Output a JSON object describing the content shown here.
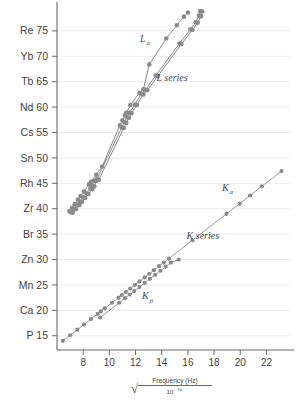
{
  "chart_data": {
    "type": "scatter",
    "title": "",
    "subtitle": "",
    "xlabel_parts": {
      "radical": "√",
      "numerator": "Frequency (Hz)",
      "denominator_base": "10",
      "denominator_exp": "15"
    },
    "ylabel": "",
    "xlim": [
      6.0,
      23.8
    ],
    "ylim": [
      12.2,
      79.5
    ],
    "grid": "horizontal-only",
    "legend_position": "inline-annotations",
    "marker_color": "#8a8a8a",
    "k_line_color": "#9a9a9a",
    "l_line_color": "#8a8a8a",
    "axis_color": "#6b6b6b",
    "gridline_color": "#ececec",
    "x_ticks": [
      8,
      10,
      12,
      14,
      16,
      18,
      20,
      22
    ],
    "y_ticks": [
      {
        "label": "P 15",
        "element": "P",
        "z": 15
      },
      {
        "label": "Ca 20",
        "element": "Ca",
        "z": 20
      },
      {
        "label": "Mn 25",
        "element": "Mn",
        "z": 25
      },
      {
        "label": "Zn 30",
        "element": "Zn",
        "z": 30
      },
      {
        "label": "Br 35",
        "element": "Br",
        "z": 35
      },
      {
        "label": "Zr 40",
        "element": "Zr",
        "z": 40
      },
      {
        "label": "Rh 45",
        "element": "Rh",
        "z": 45
      },
      {
        "label": "Sn 50",
        "element": "Sn",
        "z": 50
      },
      {
        "label": "Cs 55",
        "element": "Cs",
        "z": 55
      },
      {
        "label": "Nd 60",
        "element": "Nd",
        "z": 60
      },
      {
        "label": "Tb 65",
        "element": "Tb",
        "z": 65
      },
      {
        "label": "Yb 70",
        "element": "Yb",
        "z": 70
      },
      {
        "label": "Re 75",
        "element": "Re",
        "z": 75
      }
    ],
    "annotations": [
      {
        "name": "L-alpha",
        "base": "L",
        "sub": "α",
        "x": 12.35,
        "y": 72.8
      },
      {
        "name": "L-series",
        "base": "L series",
        "sub": "",
        "x": 13.6,
        "y": 65.2
      },
      {
        "name": "K-alpha",
        "base": "K",
        "sub": "α",
        "x": 18.6,
        "y": 43.5
      },
      {
        "name": "K-series",
        "base": "K series",
        "sub": "",
        "x": 15.9,
        "y": 34.0
      },
      {
        "name": "K-beta",
        "base": "K",
        "sub": "β",
        "x": 12.5,
        "y": 22.2
      }
    ],
    "series": [
      {
        "name": "K alpha",
        "label": "Kα",
        "points": [
          [
            6.45,
            14.0
          ],
          [
            7.0,
            15.1
          ],
          [
            7.55,
            16.2
          ],
          [
            8.05,
            17.2
          ],
          [
            8.6,
            18.3
          ],
          [
            9.1,
            19.3
          ],
          [
            9.35,
            19.8
          ],
          [
            9.65,
            20.4
          ],
          [
            10.2,
            21.5
          ],
          [
            10.7,
            22.5
          ],
          [
            10.95,
            23.0
          ],
          [
            11.25,
            23.6
          ],
          [
            11.6,
            24.3
          ],
          [
            11.95,
            25.0
          ],
          [
            12.3,
            25.7
          ],
          [
            12.7,
            26.5
          ],
          [
            13.05,
            27.2
          ],
          [
            13.4,
            27.9
          ],
          [
            13.8,
            28.7
          ],
          [
            14.15,
            29.4
          ],
          [
            14.55,
            30.2
          ],
          [
            16.35,
            33.8
          ],
          [
            18.95,
            39.0
          ],
          [
            19.95,
            41.0
          ],
          [
            20.75,
            42.6
          ],
          [
            21.65,
            44.4
          ],
          [
            23.15,
            47.4
          ]
        ]
      },
      {
        "name": "K beta",
        "label": "Kβ",
        "points": [
          [
            9.3,
            18.6
          ],
          [
            10.75,
            21.5
          ],
          [
            11.2,
            22.4
          ],
          [
            11.55,
            23.1
          ],
          [
            11.9,
            23.8
          ],
          [
            12.3,
            24.6
          ],
          [
            12.7,
            25.4
          ],
          [
            13.1,
            26.2
          ],
          [
            13.5,
            27.0
          ],
          [
            13.9,
            27.8
          ],
          [
            14.3,
            28.6
          ],
          [
            14.7,
            29.4
          ],
          [
            15.3,
            30.0
          ]
        ]
      },
      {
        "name": "L alpha",
        "label": "Lα",
        "points": [
          [
            6.95,
            39.5
          ],
          [
            7.15,
            40.2
          ],
          [
            7.35,
            40.9
          ],
          [
            7.6,
            41.8
          ],
          [
            7.8,
            42.5
          ],
          [
            8.05,
            43.4
          ],
          [
            8.45,
            44.8
          ],
          [
            8.6,
            45.3
          ],
          [
            9.0,
            46.7
          ],
          [
            9.45,
            48.3
          ],
          [
            10.8,
            56.4
          ],
          [
            11.0,
            57.4
          ],
          [
            11.2,
            58.4
          ],
          [
            11.3,
            58.9
          ],
          [
            11.6,
            60.4
          ],
          [
            12.3,
            62.8
          ],
          [
            12.6,
            63.5
          ],
          [
            13.05,
            68.4
          ],
          [
            14.35,
            73.5
          ],
          [
            15.15,
            76.1
          ],
          [
            15.7,
            77.8
          ],
          [
            16.0,
            78.6
          ]
        ]
      },
      {
        "name": "L beta",
        "label": "Lβ",
        "points": [
          [
            7.05,
            39.3
          ],
          [
            7.3,
            40.0
          ],
          [
            7.55,
            40.8
          ],
          [
            7.75,
            41.4
          ],
          [
            8.0,
            42.2
          ],
          [
            8.25,
            43.0
          ],
          [
            8.55,
            44.0
          ],
          [
            8.7,
            44.5
          ],
          [
            8.8,
            45.5
          ],
          [
            9.05,
            45.8
          ],
          [
            10.95,
            56.0
          ],
          [
            11.15,
            57.0
          ],
          [
            11.35,
            58.0
          ],
          [
            11.55,
            58.9
          ],
          [
            11.95,
            60.5
          ],
          [
            12.45,
            62.6
          ],
          [
            12.75,
            63.4
          ],
          [
            13.55,
            66.2
          ],
          [
            15.35,
            72.5
          ],
          [
            16.2,
            75.3
          ],
          [
            16.6,
            76.7
          ],
          [
            16.85,
            78.0
          ],
          [
            16.95,
            78.9
          ]
        ]
      },
      {
        "name": "L gamma",
        "label": "Lγ",
        "points": [
          [
            7.2,
            39.2
          ],
          [
            7.45,
            39.9
          ],
          [
            7.7,
            40.7
          ],
          [
            7.9,
            41.3
          ],
          [
            8.15,
            42.1
          ],
          [
            8.4,
            42.9
          ],
          [
            8.7,
            43.9
          ],
          [
            8.85,
            44.4
          ],
          [
            8.95,
            45.4
          ],
          [
            9.2,
            45.7
          ],
          [
            11.1,
            55.9
          ],
          [
            11.3,
            56.9
          ],
          [
            11.5,
            57.9
          ],
          [
            11.7,
            58.8
          ],
          [
            12.1,
            60.4
          ],
          [
            12.6,
            62.5
          ],
          [
            12.9,
            63.3
          ],
          [
            13.7,
            66.1
          ],
          [
            15.5,
            72.4
          ],
          [
            16.35,
            75.2
          ],
          [
            16.75,
            76.6
          ],
          [
            17.0,
            77.9
          ],
          [
            17.1,
            78.8
          ]
        ]
      }
    ]
  }
}
